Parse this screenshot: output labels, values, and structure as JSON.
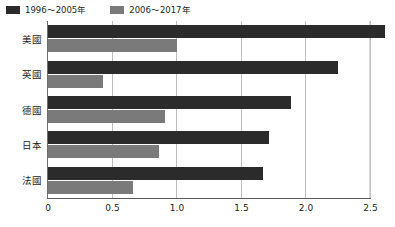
{
  "legend": {
    "position": "top-left",
    "entries": [
      {
        "label": "1996～2005年",
        "color": "#2b2b2b",
        "swatch_name": "legend-swatch-series-1"
      },
      {
        "label": "2006～2017年",
        "color": "#7a7a7a",
        "swatch_name": "legend-swatch-series-2"
      }
    ]
  },
  "axis": {
    "ticks": [
      "0",
      "0.5",
      "1.0",
      "1.5",
      "2.0",
      "2.5"
    ],
    "tick_values": [
      0,
      0.5,
      1.0,
      1.5,
      2.0,
      2.5
    ]
  },
  "categories": [
    "美國",
    "英國",
    "德國",
    "日本",
    "法國"
  ],
  "chart_data": {
    "type": "bar",
    "orientation": "horizontal",
    "title": "",
    "subtitle": "",
    "xlabel": "",
    "ylabel": "",
    "categories": [
      "美國",
      "英國",
      "德國",
      "日本",
      "法國"
    ],
    "series": [
      {
        "name": "1996～2005年",
        "color": "#2b2b2b",
        "values": [
          2.61,
          2.25,
          1.88,
          1.71,
          1.67
        ]
      },
      {
        "name": "2006～2017年",
        "color": "#7a7a7a",
        "values": [
          1.0,
          0.43,
          0.91,
          0.86,
          0.66
        ]
      }
    ],
    "xlim": [
      0,
      2.7
    ],
    "xticks": [
      0,
      0.5,
      1.0,
      1.5,
      2.0,
      2.5
    ],
    "xticklabels": [
      "0",
      "0.5",
      "1.0",
      "1.5",
      "2.0",
      "2.5"
    ],
    "grid": true,
    "grid_axis": "x",
    "legend_position": "top-left",
    "annotations": []
  }
}
